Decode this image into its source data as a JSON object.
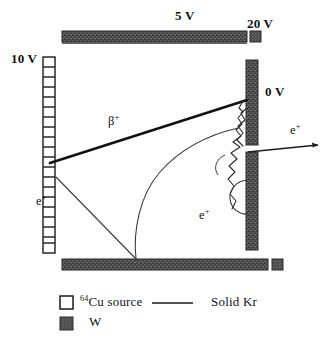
{
  "figure": {
    "type": "physics-apparatus-diagram"
  },
  "electrodes": [
    {
      "name": "source-ladder",
      "label": "10 V",
      "material": "64Cu source",
      "orientation": "vertical-left"
    },
    {
      "name": "top-bar",
      "label": "5 V",
      "material": "W",
      "orientation": "horizontal-top"
    },
    {
      "name": "corner-pad-top",
      "label": "20 V",
      "material": "W",
      "orientation": "square-top-right"
    },
    {
      "name": "right-bar",
      "label": "0 V",
      "material": "W",
      "orientation": "vertical-right"
    },
    {
      "name": "bottom-bar",
      "label": "",
      "material": "W",
      "orientation": "horizontal-bottom"
    },
    {
      "name": "corner-pad-bottom",
      "label": "",
      "material": "W",
      "orientation": "square-bottom-right"
    }
  ],
  "voltages": {
    "left": "10 V",
    "top": "5 V",
    "top_right": "20 V",
    "right": "0 V"
  },
  "tracks": [
    {
      "name": "beta-plus-track",
      "label": "β",
      "charge": "+",
      "style": "thick-straight"
    },
    {
      "name": "positron-track-left",
      "label": "e",
      "charge": "+",
      "style": "thin-straight"
    },
    {
      "name": "positron-track-center",
      "label": "e",
      "charge": "+",
      "style": "thin-curved"
    },
    {
      "name": "positron-track-exit",
      "label": "e",
      "charge": "+",
      "style": "thin-arrow"
    }
  ],
  "legend": {
    "items": [
      {
        "symbol": "open-square",
        "pre": "64",
        "label": "Cu source"
      },
      {
        "symbol": "line",
        "pre": "",
        "label": "Solid Kr"
      },
      {
        "symbol": "filled-square",
        "pre": "",
        "label": "W"
      }
    ]
  },
  "colors": {
    "tungsten": "#3b3b3b",
    "ink": "#131313",
    "background": "#ffffff"
  }
}
